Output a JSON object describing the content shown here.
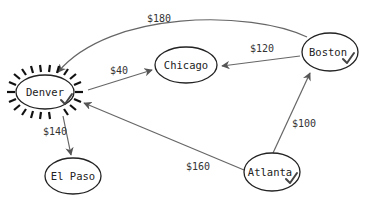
{
  "diagram": {
    "type": "directed-graph",
    "nodes": [
      {
        "id": "denver",
        "label": "Denver",
        "checked": true,
        "highlighted": true
      },
      {
        "id": "chicago",
        "label": "Chicago",
        "checked": false,
        "highlighted": false
      },
      {
        "id": "boston",
        "label": "Boston",
        "checked": true,
        "highlighted": false
      },
      {
        "id": "atlanta",
        "label": "Atlanta",
        "checked": true,
        "highlighted": false
      },
      {
        "id": "elpaso",
        "label": "El Paso",
        "checked": false,
        "highlighted": false
      }
    ],
    "edges": [
      {
        "from": "boston",
        "to": "denver",
        "label": "$180"
      },
      {
        "from": "boston",
        "to": "chicago",
        "label": "$120"
      },
      {
        "from": "denver",
        "to": "chicago",
        "label": "$40"
      },
      {
        "from": "denver",
        "to": "elpaso",
        "label": "$140"
      },
      {
        "from": "atlanta",
        "to": "denver",
        "label": "$160"
      },
      {
        "from": "atlanta",
        "to": "boston",
        "label": "$100"
      }
    ],
    "colors": {
      "node_stroke": "#222222",
      "edge_stroke": "#666666",
      "text": "#333333",
      "background": "#ffffff"
    }
  }
}
